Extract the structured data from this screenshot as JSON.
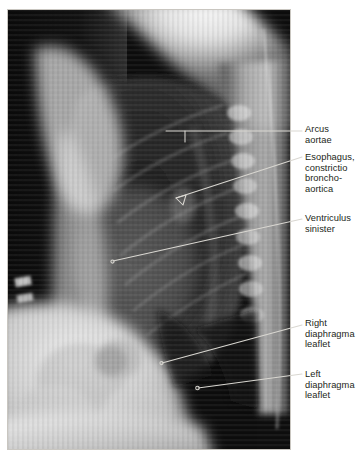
{
  "figure": {
    "type": "radiograph",
    "modality": "chest-x-ray",
    "view": "lateral",
    "frame": {
      "x": 7,
      "y": 9,
      "width": 284,
      "height": 441
    },
    "background_color": "#ffffff",
    "plate_color": "#050505",
    "leader_color": "#d8d6d0"
  },
  "labels": [
    {
      "id": "arcus-aortae",
      "text": "Arcus\naortae",
      "x": 305,
      "y": 124,
      "leader": {
        "kind": "bracket-line",
        "from": {
          "x": 302,
          "y": 131
        },
        "to": {
          "x": 166,
          "y": 131
        },
        "tick": {
          "x": 185,
          "y": 131,
          "length": 11
        }
      }
    },
    {
      "id": "esophagus-constrictio-broncho-aortica",
      "text": "Esophagus,\nconstrictio\nbroncho-\naortica",
      "x": 305,
      "y": 152,
      "leader": {
        "kind": "arrow",
        "from": {
          "x": 302,
          "y": 157
        },
        "to": {
          "x": 170,
          "y": 200
        },
        "arrowhead": "open-triangle"
      }
    },
    {
      "id": "ventriculus-sinister",
      "text": "Ventriculus\nsinister",
      "x": 305,
      "y": 213,
      "leader": {
        "kind": "line",
        "from": {
          "x": 302,
          "y": 219
        },
        "to": {
          "x": 112,
          "y": 262
        },
        "endpoint": "dot"
      }
    },
    {
      "id": "right-diaphragma-leaflet",
      "text": "Right\ndiaphragma\nleaflet",
      "x": 305,
      "y": 318,
      "leader": {
        "kind": "line",
        "from": {
          "x": 302,
          "y": 325
        },
        "to": {
          "x": 161,
          "y": 363
        },
        "endpoint": "dot"
      }
    },
    {
      "id": "left-diaphragma-leaflet",
      "text": "Left\ndiaphragma\nleaflet",
      "x": 305,
      "y": 369,
      "leader": {
        "kind": "line",
        "from": {
          "x": 302,
          "y": 374
        },
        "to": {
          "x": 197,
          "y": 388
        },
        "endpoint": "dot"
      }
    }
  ]
}
